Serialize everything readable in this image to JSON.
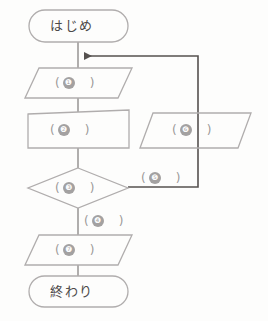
{
  "diagram": {
    "kind": "flowchart",
    "language": "ja",
    "title_text": "",
    "colors": {
      "page_background": "#fdfdfc",
      "shape_stroke": "#b0adad",
      "connector_stroke": "#8f8c8c",
      "feedback_stroke": "#55514f",
      "badge_fill": "#a3a1a1",
      "badge_text": "#fbfbfb",
      "label_text": "#8d8a8a",
      "terminal_text": "#4c4949"
    },
    "nodes": {
      "start": {
        "shape": "terminator",
        "label": "はじめ"
      },
      "step1": {
        "shape": "parallelogram",
        "open_paren": "(",
        "badge": "❶",
        "close_paren": ")"
      },
      "step2": {
        "shape": "process-box",
        "open_paren": "(",
        "badge": "❷",
        "close_paren": ")"
      },
      "decision3": {
        "shape": "diamond",
        "open_paren": "(",
        "badge": "❸",
        "close_paren": ")"
      },
      "step6": {
        "shape": "parallelogram",
        "open_paren": "(",
        "badge": "❻",
        "close_paren": ")"
      },
      "step7": {
        "shape": "parallelogram",
        "open_paren": "(",
        "badge": "❼",
        "close_paren": ")"
      },
      "end": {
        "shape": "terminator",
        "label": "終わり"
      }
    },
    "edge_labels": {
      "branch_down": {
        "open_paren": "(",
        "badge": "❹",
        "close_paren": ")"
      },
      "branch_right": {
        "open_paren": "(",
        "badge": "❺",
        "close_paren": ")"
      }
    },
    "connectors": [
      {
        "name": "start-to-step1",
        "from": "start",
        "to": "step1",
        "arrow": false
      },
      {
        "name": "step1-to-step2",
        "from": "step1",
        "to": "step2",
        "arrow": false
      },
      {
        "name": "step2-to-decision3",
        "from": "step2",
        "to": "decision3",
        "arrow": false
      },
      {
        "name": "decision3-to-step7",
        "from": "decision3",
        "to": "step7",
        "arrow": false,
        "label": "branch_down"
      },
      {
        "name": "step7-to-end",
        "from": "step7",
        "to": "end",
        "arrow": false
      },
      {
        "name": "decision3-to-loop",
        "from": "decision3",
        "to": "step6",
        "arrow": false,
        "label": "branch_right"
      },
      {
        "name": "loop-back-to-step1",
        "from": "step6",
        "to": "start-to-step1",
        "arrow": true
      }
    ]
  }
}
